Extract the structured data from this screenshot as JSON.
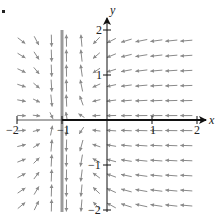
{
  "chart_data": {
    "type": "quiver",
    "title": "",
    "xlabel": "x",
    "ylabel": "y",
    "xlim": [
      -2,
      2
    ],
    "ylim": [
      -2,
      2
    ],
    "x_ticks": [
      -2,
      -1,
      1,
      2
    ],
    "y_ticks": [
      2,
      1,
      -1,
      -2
    ],
    "x_tick_labels": [
      "−2",
      "−1",
      "1",
      "2"
    ],
    "y_tick_labels": [
      "2",
      "1",
      "−1",
      "−2"
    ],
    "grid": false,
    "legend": null,
    "singular_line": {
      "x": -1,
      "color": "#9a9a9a",
      "description": "vertical line x = -1 (field direction vertical, large magnitude)"
    },
    "axis_highlight": {
      "from_x": -1,
      "to_x": 2,
      "color": "#111111",
      "description": "x-axis drawn bold from x=-1 to the right"
    },
    "field_description": "Direction field: for x > -1 arrows point left (toward x=-1) and toward the x-axis; for x < -1 arrows point right (toward x=-1) and toward the x-axis; near x = -1 arrows become vertical and long.",
    "sample_vectors": [
      {
        "region": "upper-right (x>0, y>0)",
        "direction": "down-left"
      },
      {
        "region": "lower-right (x>0, y<0)",
        "direction": "up-left"
      },
      {
        "region": "upper-left (x<-1, y>0)",
        "direction": "down-right"
      },
      {
        "region": "lower-left (x<-1, y<0)",
        "direction": "up-right"
      },
      {
        "region": "near x=-1, y>0 (right side)",
        "direction": "up, steep"
      },
      {
        "region": "near x=-1, y<0 (right side)",
        "direction": "down, steep"
      },
      {
        "region": "on x-axis, x>-1",
        "direction": "left (horizontal)"
      },
      {
        "region": "on x-axis, x<-1",
        "direction": "right (horizontal)"
      }
    ],
    "grid_step": 0.333,
    "arrow_color": "#8a8a8a"
  },
  "labels": {
    "x_axis": "x",
    "y_axis": "y",
    "xt_m2": "−2",
    "xt_m1": "−1",
    "xt_1": "1",
    "xt_2": "2",
    "yt_2": "2",
    "yt_1": "1",
    "yt_m1": "−1",
    "yt_m2": "−2"
  }
}
